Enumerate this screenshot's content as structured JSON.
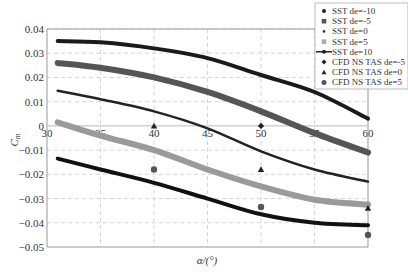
{
  "chart_data": {
    "type": "line",
    "title": "",
    "xlabel": "α/(°)",
    "ylabel": "Cm",
    "xlim": [
      30,
      60
    ],
    "ylim": [
      -0.05,
      0.04
    ],
    "xticks": [
      "30",
      "35",
      "40",
      "45",
      "50",
      "55",
      "60"
    ],
    "yticks": [
      "0.04",
      "0.03",
      "0.02",
      "0.01",
      "0",
      "-0.01",
      "-0.02",
      "-0.03",
      "-0.04",
      "-0.05"
    ],
    "grid": true,
    "legend_position": "upper right (outside/overlapping)",
    "x": [
      31,
      35,
      40,
      45,
      50,
      55,
      60
    ],
    "series": [
      {
        "name": "SST de=-10",
        "style": "line",
        "color": "#1a1a1a",
        "width": 4,
        "values": [
          0.035,
          0.0345,
          0.032,
          0.028,
          0.021,
          0.014,
          0.003
        ]
      },
      {
        "name": "SST de=-5",
        "style": "line",
        "color": "#555555",
        "width": 6,
        "values": [
          0.026,
          0.024,
          0.02,
          0.014,
          0.006,
          -0.003,
          -0.011
        ]
      },
      {
        "name": "SST de=0",
        "style": "line",
        "color": "#222222",
        "width": 2.5,
        "values": [
          0.0145,
          0.011,
          0.006,
          -0.001,
          -0.0105,
          -0.018,
          -0.023
        ]
      },
      {
        "name": "SST de=5",
        "style": "line",
        "color": "#9a9a9a",
        "width": 6,
        "values": [
          0.0015,
          -0.004,
          -0.01,
          -0.018,
          -0.025,
          -0.0305,
          -0.0325
        ]
      },
      {
        "name": "SST de=10",
        "style": "line",
        "color": "#111111",
        "width": 4,
        "values": [
          -0.0135,
          -0.018,
          -0.0235,
          -0.03,
          -0.0365,
          -0.04,
          -0.041
        ]
      },
      {
        "name": "CFD NS TAS de=-5",
        "style": "marker-diamond",
        "color": "#222222",
        "points": [
          [
            50,
            0.0
          ]
        ]
      },
      {
        "name": "CFD NS TAS de=0",
        "style": "marker-triangle",
        "color": "#222222",
        "points": [
          [
            40,
            0.0
          ],
          [
            50,
            -0.018
          ],
          [
            60,
            -0.034
          ]
        ]
      },
      {
        "name": "CFD NS TAS de=5",
        "style": "marker-circle",
        "color": "#555555",
        "points": [
          [
            40,
            -0.018
          ],
          [
            50,
            -0.0335
          ],
          [
            60,
            -0.045
          ]
        ]
      }
    ]
  }
}
